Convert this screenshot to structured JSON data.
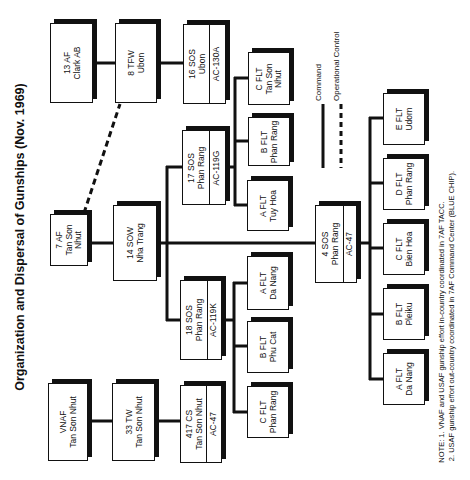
{
  "title": "Organization and Dispersal of Gunships (Nov. 1969)",
  "legend": {
    "command": "Command",
    "operational_control": "Operational Control"
  },
  "units": {
    "af13": {
      "line1": "13 AF",
      "line2": "Clark AB"
    },
    "tfw8": {
      "line1": "8 TFW",
      "line2": "Ubon"
    },
    "sos16": {
      "line1": "16 SOS",
      "line2": "Ubon",
      "aircraft": "AC-130A"
    },
    "af7": {
      "line1": "7 AF",
      "line2": "Tan Son",
      "line3": "Nhut"
    },
    "sow14": {
      "line1": "14 SOW",
      "line2": "Nha Trang"
    },
    "sos17": {
      "line1": "17 SOS",
      "line2": "Phan Rang",
      "aircraft": "AC-119G"
    },
    "sos18": {
      "line1": "18 SOS",
      "line2": "Phan Rang",
      "aircraft": "AC-119K"
    },
    "sos4": {
      "line1": "4 SOS",
      "line2": "Phan Rang",
      "aircraft": "AC-47"
    },
    "vnaf": {
      "line1": "VNAF",
      "line2": "Tan Son Nhut"
    },
    "tw33": {
      "line1": "33 TW",
      "line2": "Tan Son Nhut"
    },
    "cs417": {
      "line1": "417 CS",
      "line2": "Tan Son Nhut",
      "aircraft": "AC-47"
    }
  },
  "flights": {
    "sos17": [
      {
        "name": "C FLT",
        "loc1": "Tan Son",
        "loc2": "Nhut"
      },
      {
        "name": "B FLT",
        "loc1": "Phan Rang",
        "loc2": ""
      },
      {
        "name": "A FLT",
        "loc1": "Tuy Hoa",
        "loc2": ""
      }
    ],
    "sos18": [
      {
        "name": "A FLT",
        "loc1": "Da Nang"
      },
      {
        "name": "B FLT",
        "loc1": "Phu Cat"
      },
      {
        "name": "C FLT",
        "loc1": "Phan Rang"
      }
    ],
    "sos4": [
      {
        "name": "E FLT",
        "loc1": "Udorn"
      },
      {
        "name": "D FLT",
        "loc1": "Phan Rang"
      },
      {
        "name": "C FLT",
        "loc1": "Bien Hoa"
      },
      {
        "name": "B FLT",
        "loc1": "Pleiku"
      },
      {
        "name": "A FLT",
        "loc1": "Da Nang"
      }
    ]
  },
  "notes": {
    "line1": "NOTE:  1.  VNAF and USAF gunship effort in-country coordinated in 7AF TACC.",
    "line2": "2.  USAF gunship effort out-country coordinated in 7AF Command Center (BLUE CHIP)."
  },
  "colors": {
    "ink": "#111111",
    "paper": "#ffffff"
  }
}
